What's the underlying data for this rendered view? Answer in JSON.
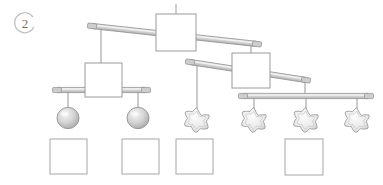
{
  "page": {
    "question_number": "2",
    "background_color": "#ffffff",
    "stroke_color": "#8a8a8a",
    "beam_fill": "#d8d8d8",
    "shape_fill": "#e8e8e8",
    "sphere_fill": "#cfcfcf",
    "star_fill": "#eeeeee",
    "answer_box_fill": "#ffffff"
  },
  "mobile": {
    "type": "hanging-balance-mobile",
    "top_hanger": {
      "x": 176,
      "y1": 4,
      "y2": 14
    },
    "fulcrums": [
      {
        "name": "top-fulcrum-square",
        "x": 156,
        "y": 14,
        "w": 40,
        "h": 37
      },
      {
        "name": "left-fulcrum-square",
        "x": 85,
        "y": 63,
        "w": 37,
        "h": 34
      },
      {
        "name": "right-fulcrum-square",
        "x": 232,
        "y": 53,
        "w": 38,
        "h": 35
      }
    ],
    "beams": [
      {
        "name": "top-beam",
        "x1": 92,
        "y1": 26,
        "x2": 257,
        "y2": 44,
        "tilt": "down-right"
      },
      {
        "name": "middle-beam",
        "x1": 190,
        "y1": 62,
        "x2": 306,
        "y2": 80,
        "tilt": "down-right"
      },
      {
        "name": "left-beam",
        "x1": 57,
        "y1": 90,
        "x2": 146,
        "y2": 90,
        "tilt": "level"
      },
      {
        "name": "bottom-beam",
        "x1": 243,
        "y1": 96,
        "x2": 369,
        "y2": 96,
        "tilt": "level"
      }
    ],
    "hangers": [
      {
        "name": "hanger-top-left-to-left-fulcrum",
        "x": 101,
        "y1": 26,
        "y2": 63
      },
      {
        "name": "hanger-top-right-to-right-fulcrum",
        "x": 251,
        "y1": 44,
        "y2": 53
      },
      {
        "name": "hanger-left-sphere",
        "x": 68,
        "y1": 90,
        "y2": 107
      },
      {
        "name": "hanger-right-sphere",
        "x": 138,
        "y1": 90,
        "y2": 107
      },
      {
        "name": "hanger-lone-star",
        "x": 197,
        "y1": 63,
        "y2": 110
      },
      {
        "name": "hanger-middle-right-to-bottom-beam",
        "x": 305,
        "y1": 80,
        "y2": 96
      },
      {
        "name": "hanger-star-a",
        "x": 254,
        "y1": 96,
        "y2": 110
      },
      {
        "name": "hanger-star-b",
        "x": 306,
        "y1": 96,
        "y2": 110
      },
      {
        "name": "hanger-star-c",
        "x": 357,
        "y1": 96,
        "y2": 110
      }
    ],
    "weights": [
      {
        "name": "sphere-1",
        "shape": "sphere",
        "cx": 68,
        "cy": 118,
        "r": 11
      },
      {
        "name": "sphere-2",
        "shape": "sphere",
        "cx": 138,
        "cy": 118,
        "r": 11
      },
      {
        "name": "star-1",
        "shape": "star",
        "cx": 197,
        "cy": 120,
        "r": 12
      },
      {
        "name": "star-2",
        "shape": "star",
        "cx": 254,
        "cy": 120,
        "r": 12
      },
      {
        "name": "star-3",
        "shape": "star",
        "cx": 306,
        "cy": 120,
        "r": 12
      },
      {
        "name": "star-4",
        "shape": "star",
        "cx": 357,
        "cy": 120,
        "r": 12
      }
    ]
  },
  "answer_boxes": [
    {
      "name": "answer-box-1",
      "x": 50,
      "y": 139,
      "w": 37,
      "h": 35,
      "value": ""
    },
    {
      "name": "answer-box-2",
      "x": 122,
      "y": 139,
      "w": 37,
      "h": 35,
      "value": ""
    },
    {
      "name": "answer-box-3",
      "x": 176,
      "y": 139,
      "w": 37,
      "h": 35,
      "value": ""
    },
    {
      "name": "answer-box-4",
      "x": 285,
      "y": 139,
      "w": 38,
      "h": 36,
      "value": ""
    }
  ]
}
